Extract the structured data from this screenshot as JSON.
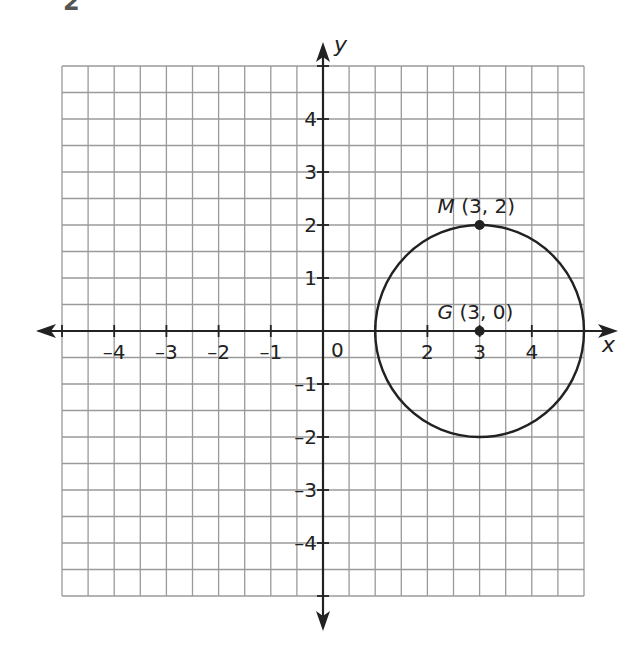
{
  "problem_number": "2",
  "chart_data": {
    "type": "scatter",
    "title": "",
    "xlabel": "x",
    "ylabel": "y",
    "xlim": [
      -5,
      5
    ],
    "ylim": [
      -5,
      5
    ],
    "grid": true,
    "grid_step": 0.5,
    "x_tick_labels": [
      "-4",
      "-3",
      "-2",
      "-1",
      "0",
      "2",
      "3",
      "4"
    ],
    "y_tick_labels": [
      "4",
      "3",
      "2",
      "1",
      "-1",
      "-2",
      "-3",
      "-4"
    ],
    "points": [
      {
        "name": "M",
        "label": "M (3, 2)",
        "x": 3,
        "y": 2
      },
      {
        "name": "G",
        "label": "G (3, 0)",
        "x": 3,
        "y": 0
      }
    ],
    "circle": {
      "center_x": 3,
      "center_y": 0,
      "radius": 2
    }
  },
  "colors": {
    "grid": "#9a9a9a",
    "axis": "#222222",
    "ink": "#222222"
  }
}
